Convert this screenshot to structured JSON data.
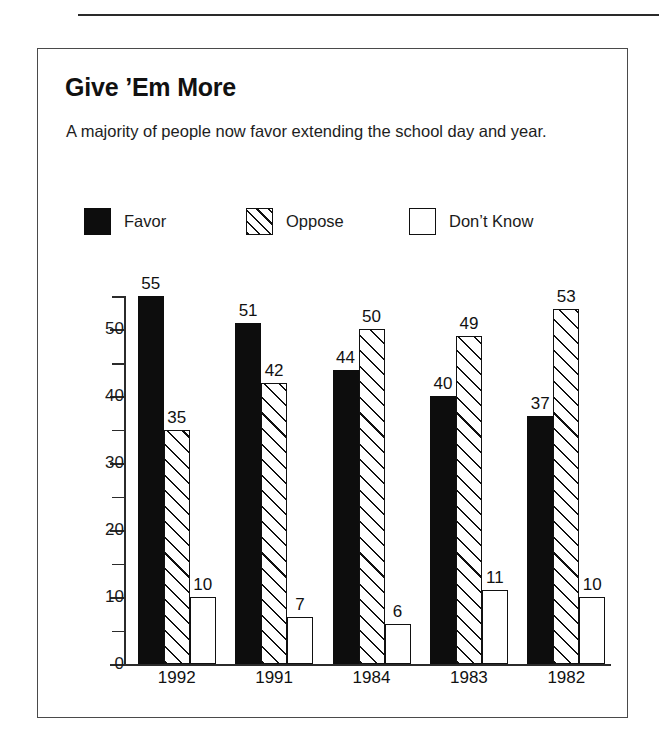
{
  "figure": {
    "title": "Give ’Em More",
    "subtitle": "A majority of people now favor extending the school day and year."
  },
  "legend": {
    "items": [
      {
        "label": "Favor",
        "swatch": "solid-black-swatch"
      },
      {
        "label": "Oppose",
        "swatch": "diagonal-hatch-swatch"
      },
      {
        "label": "Don’t Know",
        "swatch": "empty-white-swatch"
      }
    ]
  },
  "axes": {
    "y_ticks_major": [
      "0",
      "10",
      "20",
      "30",
      "40",
      "50"
    ],
    "y_ticks_minor": [
      "5",
      "15",
      "25",
      "35",
      "45",
      "55"
    ],
    "x_labels": [
      "1992",
      "1991",
      "1984",
      "1983",
      "1982"
    ]
  },
  "chart_data": {
    "type": "bar",
    "title": "Give ’Em More",
    "subtitle": "A majority of people now favor extending the school day and year.",
    "categories": [
      "1992",
      "1991",
      "1984",
      "1983",
      "1982"
    ],
    "series": [
      {
        "name": "Favor",
        "values": [
          55,
          51,
          44,
          40,
          37
        ],
        "fill": "solid-black"
      },
      {
        "name": "Oppose",
        "values": [
          35,
          42,
          50,
          49,
          53
        ],
        "fill": "diagonal-hatch"
      },
      {
        "name": "Don’t Know",
        "values": [
          10,
          7,
          6,
          11,
          10
        ],
        "fill": "white"
      }
    ],
    "xlabel": "",
    "ylabel": "",
    "ylim": [
      0,
      55
    ],
    "ytick_step": 10,
    "yminor_step": 5,
    "grid": false,
    "legend_position": "top",
    "data_labels": true,
    "units": "percent"
  },
  "colors": {
    "favor": "#0d0d0d",
    "oppose_line": "#111111",
    "dontknow": "#ffffff",
    "axis": "#2b2b2b",
    "frame": "#4a4a4a",
    "text": "#1a1a1a",
    "background": "#ffffff"
  }
}
